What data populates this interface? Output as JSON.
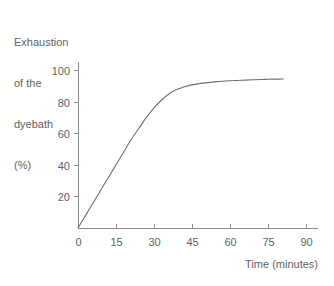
{
  "chart_data": {
    "type": "line",
    "title": "",
    "ylabel_lines": [
      "Exhaustion",
      "of the",
      "dyebath",
      "(%)"
    ],
    "ylabel": "Exhaustion of the dyebath (%)",
    "xlabel": "Time (minutes)",
    "xlim": [
      0,
      97
    ],
    "ylim": [
      0,
      107
    ],
    "xticks": [
      0,
      15,
      30,
      45,
      60,
      75,
      90
    ],
    "xtick_labels": [
      "0",
      "15",
      "30",
      "45",
      "60",
      "75",
      "90"
    ],
    "yticks": [
      20,
      40,
      60,
      80,
      100
    ],
    "ytick_labels": [
      "20",
      "40",
      "60",
      "80",
      "100"
    ],
    "grid": false,
    "legend": false,
    "series": [
      {
        "name": "exhaustion",
        "color": "#6e6e6e",
        "x": [
          0,
          3,
          6,
          9,
          12,
          15,
          18,
          21,
          24,
          27,
          30,
          33,
          36,
          39,
          42,
          45,
          48,
          51,
          54,
          57,
          60,
          63,
          66,
          69,
          72,
          75,
          78,
          81
        ],
        "values": [
          0,
          8,
          16,
          24,
          32,
          40,
          48,
          56,
          63,
          70,
          76,
          81,
          85,
          87.6,
          89.4,
          90.6,
          91.4,
          92.0,
          92.5,
          92.9,
          93.2,
          93.4,
          93.6,
          93.8,
          94.0,
          94.1,
          94.2,
          94.3
        ]
      }
    ],
    "annotations": []
  },
  "colors": {
    "background": "#ffffff",
    "axis": "#8c8c8c",
    "curve": "#6e6e6e",
    "text": "#5f5f5f"
  },
  "geometry": {
    "origin_x": 78,
    "origin_y": 228,
    "px_per_minute": 2.533,
    "px_per_percent": 1.58,
    "x_axis_end": 318,
    "y_axis_top": 62
  }
}
